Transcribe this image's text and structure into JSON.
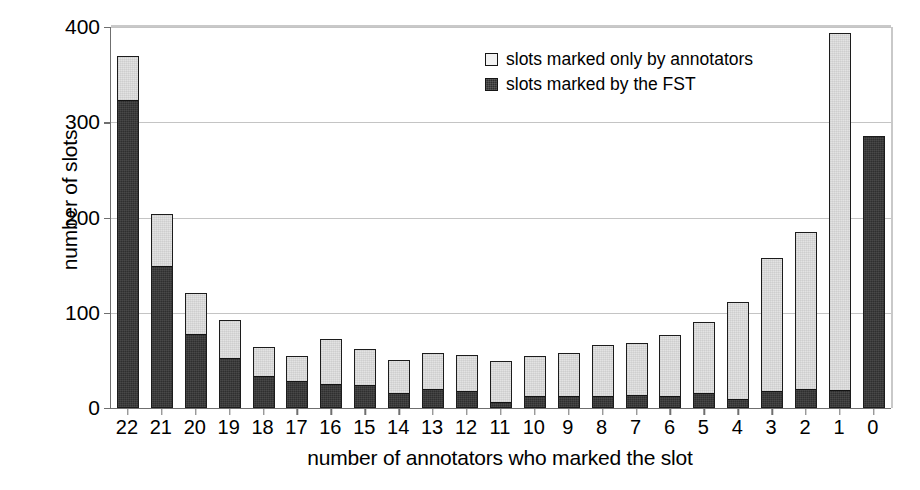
{
  "chart_data": {
    "type": "bar",
    "subtype": "stacked-vertical",
    "title": "",
    "xlabel": "number of annotators who marked the slot",
    "ylabel": "number of slots",
    "categories": [
      "22",
      "21",
      "20",
      "19",
      "18",
      "17",
      "16",
      "15",
      "14",
      "13",
      "12",
      "11",
      "10",
      "9",
      "8",
      "7",
      "6",
      "5",
      "4",
      "3",
      "2",
      "1",
      "0"
    ],
    "series": [
      {
        "name": "slots marked by the FST",
        "color": "#2f2f2f",
        "values": [
          324,
          150,
          78,
          53,
          34,
          28,
          25,
          24,
          15,
          20,
          17,
          5,
          12,
          12,
          12,
          13,
          12,
          15,
          9,
          17,
          19,
          18,
          286
        ]
      },
      {
        "name": "slots marked only by annotators",
        "color": "#e3e3e3",
        "values": [
          46,
          54,
          43,
          39,
          30,
          27,
          47,
          38,
          35,
          38,
          39,
          44,
          43,
          46,
          54,
          55,
          65,
          75,
          102,
          141,
          166,
          376,
          0
        ]
      }
    ],
    "totals": [
      370,
      204,
      121,
      92,
      64,
      55,
      72,
      62,
      50,
      58,
      56,
      49,
      55,
      58,
      66,
      68,
      77,
      90,
      111,
      158,
      185,
      394,
      286
    ],
    "ylim": [
      0,
      400
    ],
    "yticks": [
      0,
      100,
      200,
      300,
      400
    ],
    "ytick_labels": [
      "0",
      "100",
      "200",
      "300",
      "400"
    ],
    "grid": true,
    "grid_axis": "y",
    "legend_position": "upper-center"
  },
  "legend": {
    "entries": [
      {
        "label": "slots marked only by annotators",
        "swatch": "light"
      },
      {
        "label": "slots marked by the FST",
        "swatch": "dark"
      }
    ]
  }
}
